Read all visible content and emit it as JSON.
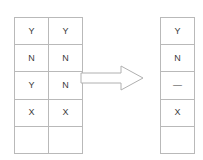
{
  "diagram": {
    "source_table": {
      "name": "source-table",
      "columns": 2,
      "rows": 5,
      "cells": [
        [
          "Y",
          "Y"
        ],
        [
          "N",
          "N"
        ],
        [
          "Y",
          "N"
        ],
        [
          "X",
          "X"
        ],
        [
          "",
          ""
        ]
      ]
    },
    "arrow": {
      "icon": "right-arrow-icon",
      "direction": "right",
      "label": ""
    },
    "result_table": {
      "name": "result-table",
      "columns": 1,
      "rows": 5,
      "cells": [
        [
          "Y"
        ],
        [
          "N"
        ],
        [
          "—"
        ],
        [
          "X"
        ],
        [
          ""
        ]
      ]
    }
  },
  "colors": {
    "background": "#ffffff",
    "grid_line": "#b9b9b9",
    "text": "#3a3a3a",
    "arrow_stroke": "#b0b0b0",
    "arrow_fill": "#ffffff"
  }
}
